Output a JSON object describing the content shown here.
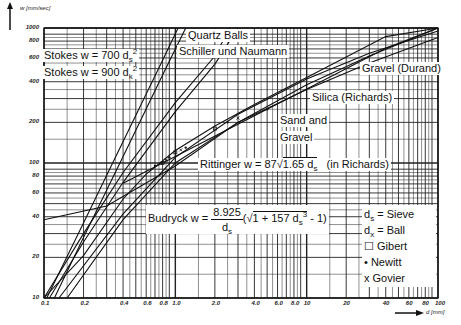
{
  "chart_data": {
    "type": "line",
    "title": "",
    "xlabel": "d [mm]",
    "ylabel": "w [mm/sec]",
    "xscale": "log",
    "yscale": "log",
    "xlim": [
      0.1,
      100
    ],
    "ylim": [
      10,
      1000
    ],
    "grid": true,
    "x_ticks": [
      "0.1",
      "0.2",
      "0.4",
      "0.6",
      "0.8",
      "1.0",
      "2.0",
      "4.0",
      "6.0",
      "8.0",
      "10",
      "20",
      "40",
      "60",
      "80",
      "100"
    ],
    "x_tick_values": [
      0.1,
      0.2,
      0.4,
      0.6,
      0.8,
      1.0,
      2.0,
      4.0,
      6.0,
      8.0,
      10,
      20,
      40,
      60,
      80,
      100
    ],
    "y_ticks": [
      "10",
      "20",
      "40",
      "60",
      "80",
      "100",
      "200",
      "400",
      "600",
      "800",
      "1000"
    ],
    "y_tick_values": [
      10,
      20,
      40,
      60,
      80,
      100,
      200,
      400,
      600,
      800,
      1000
    ],
    "series": [
      {
        "name": "Stokes w = 700 ds²",
        "x": [
          0.12,
          0.2,
          0.4,
          0.8,
          1.2
        ],
        "y": [
          10,
          28,
          112,
          448,
          1000
        ]
      },
      {
        "name": "Stokes w = 900 dk²",
        "x": [
          0.105,
          0.2,
          0.4,
          0.8,
          1.05
        ],
        "y": [
          10,
          36,
          144,
          576,
          1000
        ]
      },
      {
        "name": "Quartz Balls",
        "x": [
          0.1,
          0.2,
          0.4,
          1.0,
          2.0,
          2.6
        ],
        "y": [
          10,
          30,
          85,
          280,
          620,
          1000
        ]
      },
      {
        "name": "Schiller und Naumann",
        "x": [
          0.11,
          0.2,
          0.4,
          1.0,
          2.0,
          3.0
        ],
        "y": [
          10,
          26,
          72,
          240,
          540,
          1000
        ]
      },
      {
        "name": "Gravel (Durand)",
        "x": [
          0.1,
          0.3,
          1.0,
          3.0,
          10,
          30,
          100
        ],
        "y": [
          38,
          48,
          95,
          200,
          380,
          620,
          1000
        ]
      },
      {
        "name": "Silica (Richards)",
        "x": [
          0.15,
          0.4,
          1.0,
          3.0,
          10,
          30,
          100
        ],
        "y": [
          10,
          38,
          100,
          200,
          350,
          550,
          850
        ]
      },
      {
        "name": "Sand and Gravel",
        "x": [
          0.13,
          0.4,
          1.0,
          3.0,
          10,
          30,
          100
        ],
        "y": [
          10,
          42,
          110,
          230,
          420,
          650,
          950
        ]
      },
      {
        "name": "Rittinger w = 87√(1.65 ds) (in Richards)",
        "x": [
          0.4,
          1.0,
          4.0,
          10,
          40,
          100
        ],
        "y": [
          70.7,
          111.7,
          223.5,
          353.4,
          706.8,
          1117
        ]
      },
      {
        "name": "Budryck w = 8.925/ds (√(1+157 ds³) - 1)",
        "x": [
          0.1,
          0.2,
          0.4,
          0.6,
          1.0,
          2.0,
          4.0,
          10,
          40,
          100
        ],
        "y": [
          6.4,
          20.6,
          54.1,
          82.8,
          123.7,
          188.1,
          270.6,
          430.5,
          863.5,
          1366
        ]
      }
    ],
    "scatter": [
      {
        "name": "Gibert",
        "marker": "square",
        "points": [
          [
            0.8,
            100
          ],
          [
            1.0,
            120
          ],
          [
            2.0,
            180
          ]
        ]
      },
      {
        "name": "Newitt",
        "marker": "dot",
        "points": [
          [
            0.7,
            95
          ],
          [
            0.9,
            110
          ],
          [
            1.2,
            130
          ],
          [
            2.5,
            200
          ],
          [
            5,
            250
          ]
        ]
      },
      {
        "name": "Govier",
        "marker": "x",
        "points": [
          [
            0.85,
            105
          ],
          [
            1.1,
            125
          ],
          [
            3,
            215
          ]
        ]
      }
    ],
    "annotations": [
      "ds = Sieve",
      "dx = Ball"
    ]
  },
  "labels": {
    "y_unit": "w  [mm/sec]",
    "x_unit": "d  [mm]",
    "stokes1": "Stokes w = 700 d",
    "stokes1_sub": "s",
    "stokes1_sup": "2",
    "stokes2": "Stokes w = 900 d",
    "stokes2_sub": "k",
    "stokes2_sup": "2",
    "quartz": "Quartz Balls",
    "schiller": "Schiller und Naumann",
    "gravel_durand": "Gravel (Durand)",
    "silica": "Silica (Richards)",
    "sand1": "Sand and",
    "sand2": "Gravel",
    "rittinger_pre": "Rittinger w = 87",
    "rittinger_rad": "1.65 d",
    "rittinger_sub": "s",
    "rittinger_post": "(in Richards)",
    "budryck_pre": "Budryck w =",
    "budryck_num": "8.925",
    "budryck_den": "d",
    "budryck_den_sub": "s",
    "budryck_paren_open": "(",
    "budryck_rad": "1 + 157 d",
    "budryck_rad_sub": "s",
    "budryck_rad_sup": "3",
    "budryck_tail": " - 1)"
  },
  "legend": {
    "ds": "d",
    "ds_sub": "s",
    "ds_text": " = Sieve",
    "dx": "d",
    "dx_sub": "x",
    "dx_text": " = Ball",
    "gibert": "Gibert",
    "newitt": "Newitt",
    "govier": "Govier",
    "gibert_marker": "☐",
    "newitt_marker": "•",
    "govier_marker": "x"
  }
}
